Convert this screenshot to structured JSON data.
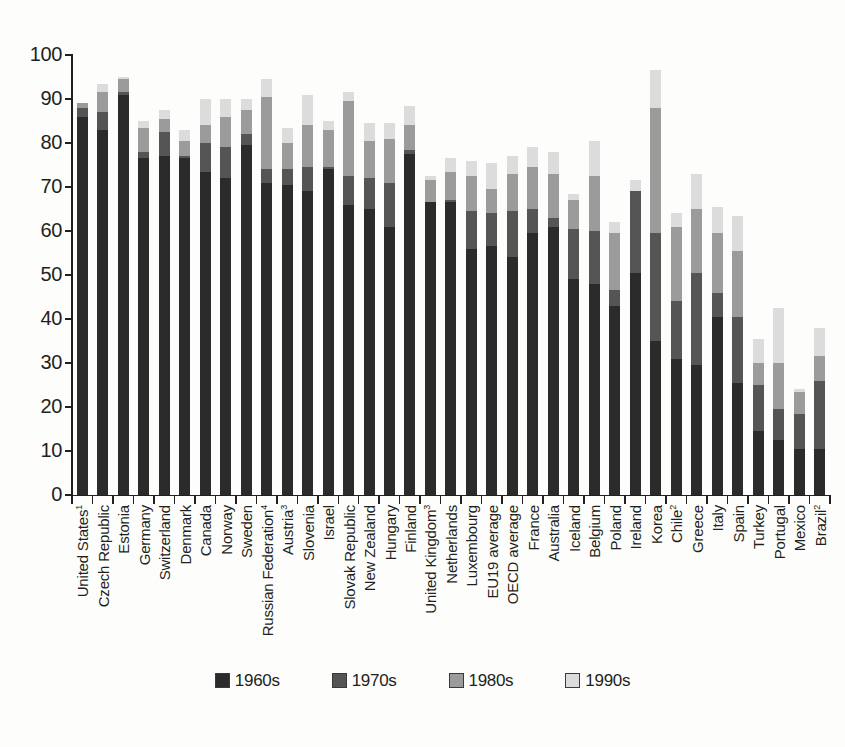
{
  "chart_data": {
    "type": "bar",
    "stacked": true,
    "title": "",
    "subtitle": "",
    "xlabel": "",
    "ylabel": "",
    "ylim": [
      0,
      100
    ],
    "yticks": [
      0,
      10,
      20,
      30,
      40,
      50,
      60,
      70,
      80,
      90,
      100
    ],
    "grid": false,
    "legend_position": "bottom-center",
    "legend": [
      "1960s",
      "1970s",
      "1980s",
      "1990s"
    ],
    "series_colors": [
      "#2b2b2b",
      "#555555",
      "#9b9b9b",
      "#dcdcdc"
    ],
    "categories": [
      "United States¹",
      "Czech Republic",
      "Estonia",
      "Germany",
      "Switzerland",
      "Denmark",
      "Canada",
      "Norway",
      "Sweden",
      "Russian Federation⁴",
      "Austria³",
      "Slovenia",
      "Israel",
      "Slovak Republic",
      "New Zealand",
      "Hungary",
      "Finland",
      "United Kingdom³",
      "Netherlands",
      "Luxembourg",
      "EU19 average",
      "OECD average",
      "France",
      "Australia",
      "Iceland",
      "Belgium",
      "Poland",
      "Ireland",
      "Korea",
      "Chile²",
      "Greece",
      "Italy",
      "Spain",
      "Turkey",
      "Portugal",
      "Mexico",
      "Brazil²"
    ],
    "categories_plain": [
      "United States",
      "Czech Republic",
      "Estonia",
      "Germany",
      "Switzerland",
      "Denmark",
      "Canada",
      "Norway",
      "Sweden",
      "Russian Federation",
      "Austria",
      "Slovenia",
      "Israel",
      "Slovak Republic",
      "New Zealand",
      "Hungary",
      "Finland",
      "United Kingdom",
      "Netherlands",
      "Luxembourg",
      "EU19 average",
      "OECD average",
      "France",
      "Australia",
      "Iceland",
      "Belgium",
      "Poland",
      "Ireland",
      "Korea",
      "Chile",
      "Greece",
      "Italy",
      "Spain",
      "Turkey",
      "Portugal",
      "Mexico",
      "Brazil"
    ],
    "category_footnotes": {
      "United States": "1",
      "Russian Federation": "4",
      "Austria": "3",
      "United Kingdom": "3",
      "Chile": "2",
      "Brazil": "2"
    },
    "series": [
      {
        "name": "1960s",
        "color": "#2b2b2b",
        "values": [
          86.0,
          83.0,
          91.0,
          76.5,
          77.0,
          76.5,
          73.5,
          72.0,
          79.5,
          71.0,
          70.5,
          69.0,
          74.0,
          66.0,
          65.0,
          61.0,
          77.5,
          66.5,
          66.5,
          56.0,
          56.5,
          54.0,
          59.5,
          61.0,
          49.0,
          48.0,
          43.0,
          50.5,
          35.0,
          31.0,
          29.5,
          40.5,
          25.5,
          14.5,
          12.5,
          10.5,
          10.5
        ]
      },
      {
        "name": "1970s",
        "color": "#555555",
        "values": [
          2.0,
          4.0,
          0.5,
          1.5,
          5.5,
          0.5,
          6.5,
          7.0,
          2.5,
          3.0,
          3.5,
          5.5,
          0.5,
          6.5,
          7.0,
          10.0,
          1.0,
          0.0,
          0.5,
          8.5,
          7.5,
          10.5,
          5.5,
          2.0,
          11.5,
          12.0,
          3.5,
          18.5,
          24.5,
          13.0,
          21.0,
          5.5,
          15.0,
          10.5,
          7.0,
          8.0,
          15.5
        ]
      },
      {
        "name": "1980s",
        "color": "#9b9b9b",
        "values": [
          1.0,
          4.5,
          3.0,
          5.5,
          3.0,
          3.5,
          4.0,
          7.0,
          5.5,
          16.5,
          6.0,
          9.5,
          8.5,
          17.0,
          8.5,
          10.0,
          5.5,
          5.0,
          6.5,
          8.0,
          5.5,
          8.5,
          9.5,
          10.0,
          6.5,
          12.5,
          13.0,
          0.0,
          28.5,
          17.0,
          14.5,
          13.5,
          15.0,
          5.0,
          10.5,
          5.0,
          5.5
        ]
      },
      {
        "name": "1990s",
        "color": "#dcdcdc",
        "values": [
          0.0,
          2.0,
          0.5,
          1.5,
          2.0,
          2.5,
          6.0,
          4.0,
          2.5,
          4.0,
          3.5,
          7.0,
          2.0,
          2.0,
          4.0,
          3.5,
          4.5,
          1.0,
          3.0,
          3.5,
          6.0,
          4.0,
          4.5,
          5.0,
          1.5,
          8.0,
          2.5,
          2.5,
          8.5,
          3.0,
          8.0,
          6.0,
          8.0,
          5.5,
          12.5,
          0.5,
          6.5
        ]
      }
    ],
    "totals": [
      89.0,
      93.5,
      95.0,
      85.0,
      87.5,
      83.0,
      90.0,
      90.0,
      90.0,
      94.5,
      83.5,
      91.0,
      85.0,
      91.5,
      84.5,
      84.5,
      88.5,
      72.5,
      76.5,
      76.0,
      75.5,
      77.0,
      79.0,
      78.0,
      68.5,
      80.5,
      62.0,
      71.5,
      96.5,
      64.0,
      73.0,
      65.5,
      63.5,
      35.5,
      42.5,
      24.0,
      38.0
    ]
  },
  "legend": {
    "items": [
      {
        "label": "1960s",
        "color": "#2b2b2b"
      },
      {
        "label": "1970s",
        "color": "#555555"
      },
      {
        "label": "1980s",
        "color": "#9b9b9b"
      },
      {
        "label": "1990s",
        "color": "#dcdcdc"
      }
    ]
  },
  "axis": {
    "y_ticks": [
      "100",
      "90",
      "80",
      "70",
      "60",
      "50",
      "40",
      "30",
      "20",
      "10",
      "0"
    ]
  }
}
